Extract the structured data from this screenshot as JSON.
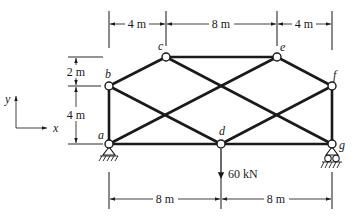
{
  "figure": {
    "type": "planar truss diagram",
    "axes": {
      "x_label": "x",
      "y_label": "y"
    },
    "nodes": [
      {
        "id": "a",
        "label": "a",
        "x": 109,
        "y": 144
      },
      {
        "id": "b",
        "label": "b",
        "x": 109,
        "y": 86
      },
      {
        "id": "c",
        "label": "c",
        "x": 166,
        "y": 57
      },
      {
        "id": "d",
        "label": "d",
        "x": 221,
        "y": 144
      },
      {
        "id": "e",
        "label": "e",
        "x": 277,
        "y": 57
      },
      {
        "id": "f",
        "label": "f",
        "x": 332,
        "y": 86
      },
      {
        "id": "g",
        "label": "g",
        "x": 332,
        "y": 144
      }
    ],
    "members": [
      [
        "a",
        "b"
      ],
      [
        "b",
        "c"
      ],
      [
        "c",
        "e"
      ],
      [
        "e",
        "f"
      ],
      [
        "f",
        "g"
      ],
      [
        "a",
        "d"
      ],
      [
        "d",
        "g"
      ],
      [
        "a",
        "e"
      ],
      [
        "b",
        "d"
      ],
      [
        "c",
        "g"
      ],
      [
        "d",
        "f"
      ]
    ],
    "supports": {
      "a": "pin",
      "g": "roller"
    },
    "load": {
      "node": "d",
      "label": "60 kN",
      "direction": "down"
    },
    "dimensions": {
      "top": [
        "4 m",
        "8 m",
        "4 m"
      ],
      "left": [
        "2 m",
        "4 m"
      ],
      "bottom": [
        "8 m",
        "8 m"
      ]
    }
  }
}
